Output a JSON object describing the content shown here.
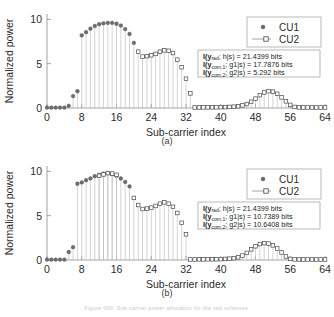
{
  "figure": {
    "panels": [
      {
        "id": "a",
        "caption": "(a)",
        "xlabel": "Sub-carrier index",
        "ylabel": "Normalized power",
        "xticks": [
          0,
          8,
          16,
          24,
          32,
          40,
          48,
          56,
          64
        ],
        "yticks": [
          0,
          5,
          10
        ],
        "xlim": [
          0,
          64
        ],
        "ylim": [
          0,
          10.6
        ],
        "legend": [
          {
            "label": "CU1",
            "marker": "filled-circle",
            "color": "#6d6d6d"
          },
          {
            "label": "CU2",
            "marker": "open-square",
            "color": "#4a4a4a"
          }
        ],
        "annotations": [
          {
            "lhs_pre": "I(y",
            "lhs_sub": "rad",
            "lhs_mid": "; h|s) = ",
            "value": "21.4399",
            "unit": "bits",
            "text": "I(yrad; h|s) = 21.4399 bits"
          },
          {
            "lhs_pre": "I(y",
            "lhs_sub": "com,1",
            "lhs_mid": "; g1|s) = ",
            "value": "17.7876",
            "unit": "bits",
            "text": "I(ycom,1; g1|s) = 17.7876 bits"
          },
          {
            "lhs_pre": "I(y",
            "lhs_sub": "com,2",
            "lhs_mid": "; g2|s) = ",
            "value": "5.292",
            "unit": "bits",
            "text": "I(ycom,2; g2|s) = 5.292 bits"
          }
        ]
      },
      {
        "id": "b",
        "caption": "(b)",
        "xlabel": "Sub-carrier index",
        "ylabel": "Normalized power",
        "xticks": [
          0,
          8,
          16,
          24,
          32,
          40,
          48,
          56,
          64
        ],
        "yticks": [
          0,
          5,
          10
        ],
        "xlim": [
          0,
          64
        ],
        "ylim": [
          0,
          10.6
        ],
        "legend": [
          {
            "label": "CU1",
            "marker": "filled-circle",
            "color": "#6d6d6d"
          },
          {
            "label": "CU2",
            "marker": "open-square",
            "color": "#4a4a4a"
          }
        ],
        "annotations": [
          {
            "lhs_pre": "I(y",
            "lhs_sub": "rad",
            "lhs_mid": "; h|s) = ",
            "value": "21.4399",
            "unit": "bits",
            "text": "I(yrad; h|s) = 21.4399 bits"
          },
          {
            "lhs_pre": "I(y",
            "lhs_sub": "com,1",
            "lhs_mid": "; g1|s) = ",
            "value": "10.7389",
            "unit": "bits",
            "text": "I(ycom,1; g1|s) = 10.7389 bits"
          },
          {
            "lhs_pre": "I(y",
            "lhs_sub": "com,2",
            "lhs_mid": "; g2|s) = ",
            "value": "10.6408",
            "unit": "bits",
            "text": "I(ycom,2; g2|s) = 10.6408 bits"
          }
        ]
      }
    ],
    "footer_caption": "Figure 000. Sub-carrier power allocation for the two schemes."
  },
  "chart_data": [
    {
      "type": "line",
      "title": "(a)",
      "xlabel": "Sub-carrier index",
      "ylabel": "Normalized power",
      "xlim": [
        0,
        64
      ],
      "ylim": [
        0,
        10.6
      ],
      "xticks": [
        0,
        8,
        16,
        24,
        32,
        40,
        48,
        56,
        64
      ],
      "yticks": [
        0,
        5,
        10
      ],
      "grid": false,
      "legend_position": "upper-right",
      "series": [
        {
          "name": "CU1",
          "marker": "filled-circle",
          "x": [
            0,
            1,
            2,
            3,
            4,
            5,
            6,
            7,
            8,
            9,
            10,
            11,
            12,
            13,
            14,
            15,
            16,
            17,
            18,
            19,
            20
          ],
          "values": [
            0.05,
            0.05,
            0.05,
            0.05,
            0.05,
            0.25,
            1.35,
            1.9,
            8.2,
            8.55,
            8.95,
            9.25,
            9.45,
            9.55,
            9.6,
            9.6,
            9.5,
            9.3,
            8.9,
            8.35,
            7.35
          ]
        },
        {
          "name": "CU2",
          "marker": "open-square",
          "x": [
            21,
            22,
            23,
            24,
            25,
            26,
            27,
            28,
            29,
            30,
            31,
            32,
            33,
            34,
            35,
            36,
            37,
            38,
            39,
            40,
            41,
            42,
            43,
            44,
            45,
            46,
            47,
            48,
            49,
            50,
            51,
            52,
            53,
            54,
            55,
            56,
            57,
            58,
            59,
            60,
            61,
            62,
            63,
            64
          ],
          "values": [
            6.35,
            5.8,
            5.85,
            5.95,
            6.1,
            6.35,
            6.5,
            6.45,
            6.2,
            5.45,
            4.6,
            3.3,
            1.65,
            0.06,
            0.06,
            0.07,
            0.07,
            0.08,
            0.08,
            0.09,
            0.1,
            0.12,
            0.15,
            0.2,
            0.3,
            0.45,
            0.7,
            1.05,
            1.45,
            1.75,
            1.9,
            1.85,
            1.6,
            1.2,
            0.75,
            0.35,
            0.12,
            0.07,
            0.06,
            0.06,
            0.06,
            0.06,
            0.06,
            0.06
          ]
        }
      ]
    },
    {
      "type": "line",
      "title": "(b)",
      "xlabel": "Sub-carrier index",
      "ylabel": "Normalized power",
      "xlim": [
        0,
        64
      ],
      "ylim": [
        0,
        10.6
      ],
      "xticks": [
        0,
        8,
        16,
        24,
        32,
        40,
        48,
        56,
        64
      ],
      "yticks": [
        0,
        5,
        10
      ],
      "grid": false,
      "legend_position": "upper-right",
      "series": [
        {
          "name": "CU1",
          "marker": "filled-circle",
          "x": [
            0,
            1,
            2,
            3,
            4,
            5,
            6,
            7,
            8,
            9,
            10,
            11,
            12,
            13,
            14,
            15,
            16,
            17,
            18,
            19
          ],
          "values": [
            0.05,
            0.05,
            0.05,
            0.05,
            0.05,
            0.9,
            1.45,
            8.6,
            8.75,
            9.0,
            9.2,
            9.45,
            9.6,
            9.75,
            9.8,
            9.7,
            9.5,
            9.2,
            8.8,
            8.3
          ]
        },
        {
          "name": "CU2",
          "marker": "open-square",
          "x": [
            12,
            13,
            14,
            15,
            16,
            20,
            21,
            22,
            23,
            24,
            25,
            26,
            27,
            28,
            29,
            30,
            31,
            32,
            33,
            34,
            35,
            36,
            37,
            38,
            39,
            40,
            41,
            42,
            43,
            44,
            45,
            46,
            47,
            48,
            49,
            50,
            51,
            52,
            53,
            54,
            55,
            56,
            57,
            58,
            59,
            60,
            61,
            62,
            63,
            64
          ],
          "values": [
            9.5,
            9.65,
            9.8,
            9.75,
            9.6,
            7.0,
            6.2,
            5.75,
            5.8,
            5.9,
            6.1,
            6.35,
            6.5,
            6.35,
            6.0,
            5.3,
            4.2,
            2.9,
            0.06,
            0.06,
            0.07,
            0.07,
            0.08,
            0.08,
            0.09,
            0.1,
            0.12,
            0.15,
            0.2,
            0.3,
            0.5,
            0.8,
            1.2,
            1.55,
            1.8,
            1.9,
            1.85,
            1.65,
            1.3,
            0.85,
            0.4,
            0.12,
            0.07,
            0.06,
            0.06,
            0.06,
            0.06,
            0.06,
            0.06,
            0.06
          ]
        }
      ]
    }
  ]
}
